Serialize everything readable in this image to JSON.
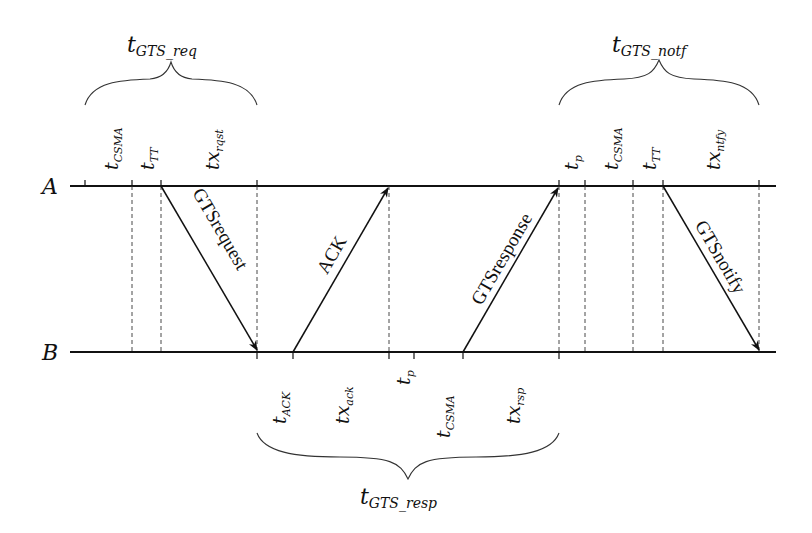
{
  "diagram": {
    "type": "timing-sequence",
    "nodes": [
      {
        "id": "A",
        "label": "A"
      },
      {
        "id": "B",
        "label": "B"
      }
    ],
    "messages": [
      {
        "label": "GTSrequest",
        "from": "A",
        "to": "B"
      },
      {
        "label": "ACK",
        "from": "B",
        "to": "A"
      },
      {
        "label": "GTSresponse",
        "from": "B",
        "to": "A"
      },
      {
        "label": "GTSnotify",
        "from": "A",
        "to": "B"
      }
    ],
    "top_intervals": [
      {
        "base": "t",
        "sub": "CSMA"
      },
      {
        "base": "t",
        "sub": "TT"
      },
      {
        "base": "tx",
        "sub": "rqst"
      },
      {
        "base": "t",
        "sub": "p"
      },
      {
        "base": "t",
        "sub": "CSMA"
      },
      {
        "base": "t",
        "sub": "TT"
      },
      {
        "base": "tx",
        "sub": "ntfy"
      }
    ],
    "bottom_intervals": [
      {
        "base": "t",
        "sub": "ACK"
      },
      {
        "base": "tx",
        "sub": "ack"
      },
      {
        "base": "t",
        "sub": "p"
      },
      {
        "base": "t",
        "sub": "CSMA"
      },
      {
        "base": "tx",
        "sub": "rsp"
      }
    ],
    "braces": [
      {
        "base": "t",
        "sub": "GTS_req"
      },
      {
        "base": "t",
        "sub": "GTS_notf"
      },
      {
        "base": "t",
        "sub": "GTS_resp"
      }
    ]
  }
}
